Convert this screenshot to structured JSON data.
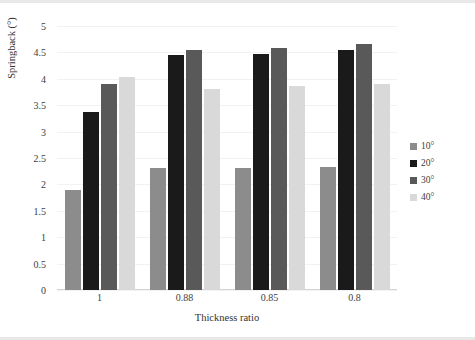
{
  "chart_data": {
    "type": "bar",
    "title": "",
    "xlabel": "Thickness ratio",
    "ylabel": "Springback (°)",
    "categories": [
      "1",
      "0.88",
      "0.85",
      "0.8"
    ],
    "series": [
      {
        "name": "10°",
        "color": "#8c8c8c",
        "values": [
          1.89,
          2.31,
          2.31,
          2.33
        ]
      },
      {
        "name": "20°",
        "color": "#1a1a1a",
        "values": [
          3.38,
          4.46,
          4.47,
          4.54
        ]
      },
      {
        "name": "30°",
        "color": "#595959",
        "values": [
          3.91,
          4.55,
          4.59,
          4.65
        ]
      },
      {
        "name": "40°",
        "color": "#d9d9d9",
        "values": [
          4.03,
          3.81,
          3.86,
          3.9
        ]
      }
    ],
    "ylim": [
      0,
      5
    ],
    "y_ticks": [
      "0",
      "0.5",
      "1",
      "1.5",
      "2",
      "2.5",
      "3",
      "3.5",
      "4",
      "4.5",
      "5"
    ],
    "y_tick_values": [
      0,
      0.5,
      1,
      1.5,
      2,
      2.5,
      3,
      3.5,
      4,
      4.5,
      5
    ],
    "grid": true,
    "legend_position": "right"
  }
}
